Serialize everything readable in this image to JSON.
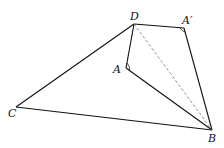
{
  "diagram": {
    "type": "geometry-figure",
    "points": {
      "D": {
        "label": "D",
        "x": 134,
        "y": 24
      },
      "A_prime": {
        "label": "A′",
        "x": 184,
        "y": 28
      },
      "A": {
        "label": "A",
        "x": 126,
        "y": 68
      },
      "C": {
        "label": "C",
        "x": 16,
        "y": 107
      },
      "B": {
        "label": "B",
        "x": 212,
        "y": 130
      }
    },
    "segments": [
      {
        "from": "C",
        "to": "D",
        "style": "solid"
      },
      {
        "from": "D",
        "to": "A_prime",
        "style": "solid"
      },
      {
        "from": "A_prime",
        "to": "B",
        "style": "solid"
      },
      {
        "from": "D",
        "to": "A",
        "style": "solid"
      },
      {
        "from": "A",
        "to": "B",
        "style": "solid"
      },
      {
        "from": "C",
        "to": "B",
        "style": "solid"
      },
      {
        "from": "D",
        "to": "B",
        "style": "dashed"
      }
    ],
    "right_angle_marks": [
      "A",
      "A_prime"
    ],
    "colors": {
      "line": "#111111",
      "dashed": "#777777"
    }
  }
}
